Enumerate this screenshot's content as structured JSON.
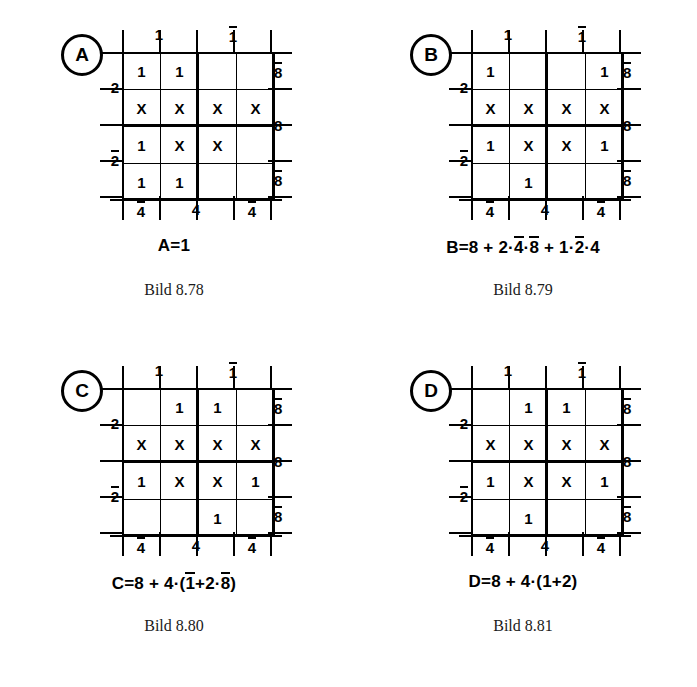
{
  "page": {
    "background": "#ffffff",
    "ink": "#000000"
  },
  "axis_labels": {
    "top_left": "1",
    "top_right": "1",
    "top_right_overline": true,
    "bottom_left": "4",
    "bottom_left_overline": true,
    "bottom_mid": "4",
    "bottom_right": "4",
    "bottom_right_overline": true,
    "left_top": "2",
    "left_bottom": "2",
    "left_bottom_overline": true,
    "right_top": "8",
    "right_top_overline": true,
    "right_mid": "8",
    "right_bottom": "8",
    "right_bottom_overline": true
  },
  "panels": [
    {
      "id": "a",
      "badge": "A",
      "cells": [
        [
          "1",
          "1",
          "",
          ""
        ],
        [
          "X",
          "X",
          "X",
          "X"
        ],
        [
          "1",
          "X",
          "X",
          ""
        ],
        [
          "1",
          "1",
          "",
          ""
        ]
      ],
      "formula_plain": "A=1",
      "formula_parts": [
        {
          "t": "A=1",
          "bar": false
        }
      ],
      "caption": "Bild 8.78"
    },
    {
      "id": "b",
      "badge": "B",
      "cells": [
        [
          "1",
          "",
          "",
          "1"
        ],
        [
          "X",
          "X",
          "X",
          "X"
        ],
        [
          "1",
          "X",
          "X",
          "1"
        ],
        [
          "",
          "1",
          "",
          ""
        ]
      ],
      "formula_plain": "B=8 + 2·4̄·8̄ + 1·2̄·4",
      "formula_parts": [
        {
          "t": "B=8 + 2·",
          "bar": false
        },
        {
          "t": "4",
          "bar": true
        },
        {
          "t": "·",
          "bar": false
        },
        {
          "t": "8",
          "bar": true
        },
        {
          "t": " + 1·",
          "bar": false
        },
        {
          "t": "2",
          "bar": true
        },
        {
          "t": "·4",
          "bar": false
        }
      ],
      "caption": "Bild 8.79"
    },
    {
      "id": "c",
      "badge": "C",
      "cells": [
        [
          "",
          "1",
          "1",
          ""
        ],
        [
          "X",
          "X",
          "X",
          "X"
        ],
        [
          "1",
          "X",
          "X",
          "1"
        ],
        [
          "",
          "",
          "1",
          ""
        ]
      ],
      "formula_plain": "C=8 + 4·(1̄+2·8̄)",
      "formula_parts": [
        {
          "t": "C=8 + 4·(",
          "bar": false
        },
        {
          "t": "1",
          "bar": true
        },
        {
          "t": "+2·",
          "bar": false
        },
        {
          "t": "8",
          "bar": true
        },
        {
          "t": ")",
          "bar": false
        }
      ],
      "caption": "Bild 8.80"
    },
    {
      "id": "d",
      "badge": "D",
      "cells": [
        [
          "",
          "1",
          "1",
          ""
        ],
        [
          "X",
          "X",
          "X",
          "X"
        ],
        [
          "1",
          "X",
          "X",
          "1"
        ],
        [
          "",
          "1",
          "",
          ""
        ]
      ],
      "formula_plain": "D=8 + 4·(1+2)",
      "formula_parts": [
        {
          "t": "D=8 + 4·(1+2)",
          "bar": false
        }
      ],
      "caption": "Bild 8.81"
    }
  ]
}
